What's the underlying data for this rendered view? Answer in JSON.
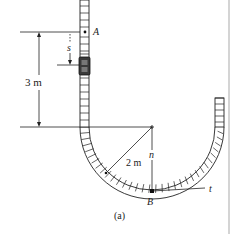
{
  "figure": {
    "caption": "(a)",
    "labels": {
      "point_a": "A",
      "point_b": "B",
      "displacement": "s",
      "height": "3 m",
      "radius": "2 m",
      "normal_axis": "n",
      "tangent_axis": "t"
    },
    "colors": {
      "ink": "#222222",
      "track_fill": "#ffffff",
      "car_fill": "#3a3a3a",
      "edge_rule": "#cfcfcf"
    }
  }
}
